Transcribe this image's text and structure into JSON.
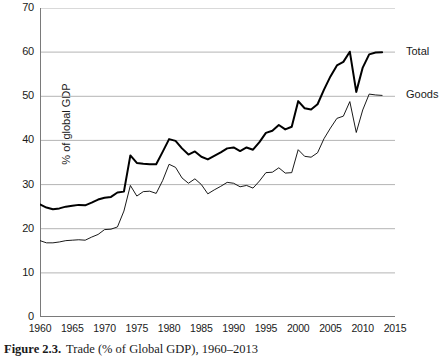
{
  "figure": {
    "number_label": "Figure 2.3.",
    "caption_text": "Trade (% of Global GDP), 1960–2013"
  },
  "chart_data": {
    "type": "line",
    "title": "Trade (% of Global GDP), 1960–2013",
    "xlabel": "",
    "ylabel": "% of global GDP",
    "xlim": [
      1960,
      2015
    ],
    "ylim": [
      0,
      70
    ],
    "ytick_values": [
      0,
      10,
      20,
      30,
      40,
      50,
      60,
      70
    ],
    "ytick_labels": [
      "0",
      "10",
      "20",
      "30",
      "40",
      "50",
      "60",
      "70"
    ],
    "xtick_values": [
      1960,
      1965,
      1970,
      1975,
      1980,
      1985,
      1990,
      1995,
      2000,
      2005,
      2010,
      2015
    ],
    "xtick_labels": [
      "1960",
      "1965",
      "1970",
      "1975",
      "1980",
      "1985",
      "1990",
      "1995",
      "2000",
      "2005",
      "2010",
      "2015"
    ],
    "grid": "horizontal",
    "grid_color": "#b4b4b4",
    "legend_position": "right-inline",
    "x": [
      1960,
      1961,
      1962,
      1963,
      1964,
      1965,
      1966,
      1967,
      1968,
      1969,
      1970,
      1971,
      1972,
      1973,
      1974,
      1975,
      1976,
      1977,
      1978,
      1979,
      1980,
      1981,
      1982,
      1983,
      1984,
      1985,
      1986,
      1987,
      1988,
      1989,
      1990,
      1991,
      1992,
      1993,
      1994,
      1995,
      1996,
      1997,
      1998,
      1999,
      2000,
      2001,
      2002,
      2003,
      2004,
      2005,
      2006,
      2007,
      2008,
      2009,
      2010,
      2011,
      2012,
      2013
    ],
    "series": [
      {
        "name": "Total",
        "color": "#000000",
        "line_width": 2.0,
        "label_text": "Total",
        "values": [
          25.5,
          24.8,
          24.4,
          24.6,
          25.0,
          25.2,
          25.4,
          25.3,
          25.9,
          26.6,
          27.0,
          27.2,
          28.2,
          28.4,
          36.6,
          34.9,
          34.7,
          34.6,
          34.6,
          37.4,
          40.3,
          39.9,
          38.2,
          36.8,
          37.5,
          36.3,
          35.7,
          36.5,
          37.3,
          38.2,
          38.4,
          37.6,
          38.4,
          37.9,
          39.6,
          41.7,
          42.2,
          43.5,
          42.5,
          43.1,
          48.9,
          47.3,
          47.0,
          48.2,
          51.5,
          54.5,
          57.0,
          57.8,
          60.1,
          51.0,
          56.5,
          59.5,
          59.9,
          60.0
        ]
      },
      {
        "name": "Goods",
        "color": "#000000",
        "line_width": 0.9,
        "label_text": "Goods",
        "values": [
          17.3,
          16.8,
          16.8,
          17.0,
          17.3,
          17.4,
          17.5,
          17.4,
          18.1,
          18.7,
          19.8,
          19.9,
          20.4,
          24.0,
          29.8,
          27.4,
          28.4,
          28.5,
          28.0,
          30.9,
          34.6,
          33.9,
          31.5,
          30.3,
          31.3,
          30.0,
          27.9,
          28.8,
          29.6,
          30.5,
          30.3,
          29.5,
          29.8,
          29.2,
          30.8,
          32.7,
          32.8,
          33.8,
          32.6,
          32.7,
          37.9,
          36.4,
          36.2,
          37.2,
          40.4,
          42.8,
          45.0,
          45.5,
          48.8,
          41.8,
          46.9,
          50.5,
          50.3,
          50.2
        ]
      }
    ]
  }
}
